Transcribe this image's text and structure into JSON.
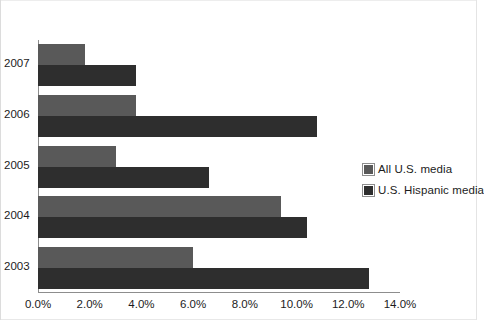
{
  "top_caption": "",
  "chart_data": {
    "type": "bar",
    "orientation": "horizontal",
    "title": "",
    "subtitle": "",
    "xlabel": "",
    "ylabel": "",
    "categories": [
      "2007",
      "2006",
      "2005",
      "2004",
      "2003"
    ],
    "series": [
      {
        "name": "All U.S. media",
        "color": "#595959",
        "values": [
          1.8,
          3.8,
          3.0,
          9.4,
          6.0
        ]
      },
      {
        "name": "U.S. Hispanic media",
        "color": "#2e2e2e",
        "values": [
          3.8,
          10.8,
          6.6,
          10.4,
          12.8
        ]
      }
    ],
    "xlim": [
      0,
      14
    ],
    "xticks": [
      "0.0%",
      "2.0%",
      "4.0%",
      "6.0%",
      "8.0%",
      "10.0%",
      "12.0%",
      "14.0%"
    ],
    "xtick_values": [
      0,
      2,
      4,
      6,
      8,
      10,
      12,
      14
    ],
    "grid": false,
    "legend_position": "right",
    "value_suffix": "%"
  },
  "legend": {
    "items": [
      {
        "label": "All U.S. media",
        "color": "#595959"
      },
      {
        "label": "U.S. Hispanic media",
        "color": "#2e2e2e"
      }
    ]
  },
  "colors": {
    "series_all_us_media": "#595959",
    "series_us_hispanic_media": "#2e2e2e",
    "axis": "#8d8d8d",
    "text": "#1c1c1c",
    "background": "#ffffff"
  }
}
